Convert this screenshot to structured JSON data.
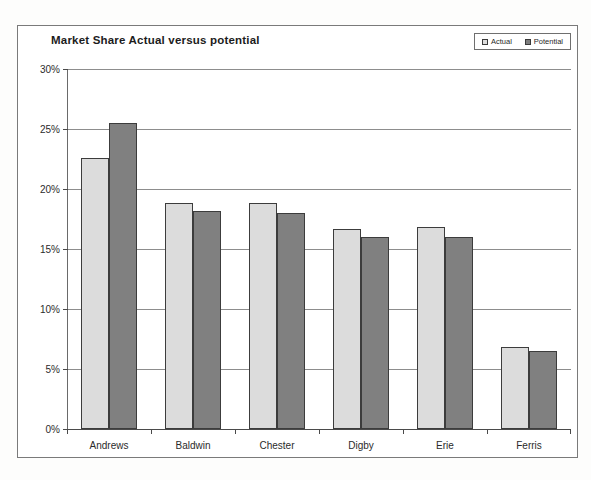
{
  "chart": {
    "title": "Market Share Actual versus potential",
    "legend": [
      {
        "label": "Actual",
        "color": "#dcdcdc"
      },
      {
        "label": "Potential",
        "color": "#808080"
      }
    ]
  },
  "chart_data": {
    "type": "bar",
    "title": "Market Share Actual versus potential",
    "xlabel": "",
    "ylabel": "",
    "ylim": [
      0,
      30
    ],
    "ytick_labels": [
      "0%",
      "5%",
      "10%",
      "15%",
      "20%",
      "25%",
      "30%"
    ],
    "ytick_values": [
      0,
      5,
      10,
      15,
      20,
      25,
      30
    ],
    "grid": true,
    "legend_position": "top-right",
    "value_unit": "%",
    "categories": [
      "Andrews",
      "Baldwin",
      "Chester",
      "Digby",
      "Erie",
      "Ferris"
    ],
    "series": [
      {
        "name": "Actual",
        "color": "#dcdcdc",
        "values": [
          22.6,
          18.8,
          18.8,
          16.7,
          16.8,
          6.8
        ]
      },
      {
        "name": "Potential",
        "color": "#808080",
        "values": [
          25.5,
          18.2,
          18.0,
          16.0,
          16.0,
          6.5
        ]
      }
    ]
  }
}
